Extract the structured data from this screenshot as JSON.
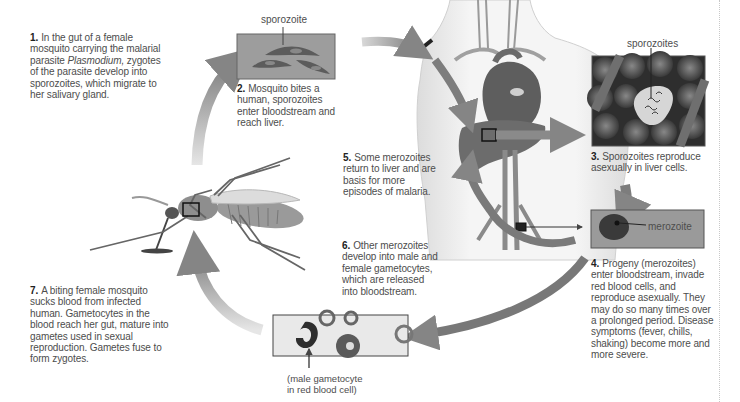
{
  "diagram": {
    "type": "life-cycle",
    "colors": {
      "arrow": "#8a8a8a",
      "panel_gray": "#9a9a9a",
      "panel_dark": "#3a3a3a",
      "body": "#efefef",
      "organ": "#6a6a6a",
      "text": "#4d4d4d"
    },
    "steps": [
      {
        "number": "1.",
        "text_before": "In the gut of a female mosquito carrying the malarial parasite ",
        "italic": "Plasmodium,",
        "text_after": " zygotes of the parasite develop into sporozoites, which migrate to her salivary gland."
      },
      {
        "number": "2.",
        "text": "Mosquito bites a human, sporozoites enter bloodstream and reach liver."
      },
      {
        "number": "3.",
        "text": "Sporozoites reproduce asexually in liver cells."
      },
      {
        "number": "4.",
        "text": "Progeny (merozoites) enter bloodstream, invade red blood cells, and reproduce asexually. They may do so many times over a prolonged period. Disease symptoms (fever, chills, shaking) become more and more severe."
      },
      {
        "number": "5.",
        "text": "Some merozoites return to liver and are basis for more episodes of malaria."
      },
      {
        "number": "6.",
        "text": "Other merozoites develop into male and female gametocytes, which are released into bloodstream."
      },
      {
        "number": "7.",
        "text": "A biting female mosquito sucks blood from infected human. Gametocytes in the blood reach her gut, mature into gametes used in sexual reproduction. Gametes fuse to form zygotes."
      }
    ],
    "labels": {
      "sporozoite": "sporozoite",
      "sporozoites": "sporozoites",
      "merozoite": "merozoite",
      "gametocyte_caption": "(male gametocyte in red blood cell)"
    },
    "illustrations": [
      "mosquito-illustration",
      "human-torso-illustration",
      "sporozoite-panel",
      "liver-cells-panel",
      "red-blood-cell-panel",
      "gametocyte-panel"
    ]
  }
}
